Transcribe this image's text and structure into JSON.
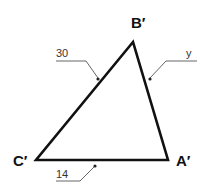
{
  "diagram": {
    "type": "triangle",
    "colors": {
      "stroke": "#111111",
      "leader": "#555555",
      "background": "#ffffff"
    },
    "vertices": [
      {
        "id": "B",
        "label": "B′",
        "x": 133,
        "y": 42
      },
      {
        "id": "C",
        "label": "C′",
        "x": 36,
        "y": 160
      },
      {
        "id": "A",
        "label": "A′",
        "x": 168,
        "y": 160
      }
    ],
    "sides": [
      {
        "between": [
          "C",
          "B"
        ],
        "label": "30"
      },
      {
        "between": [
          "B",
          "A"
        ],
        "label": "y"
      },
      {
        "between": [
          "C",
          "A"
        ],
        "label": "14"
      }
    ]
  }
}
